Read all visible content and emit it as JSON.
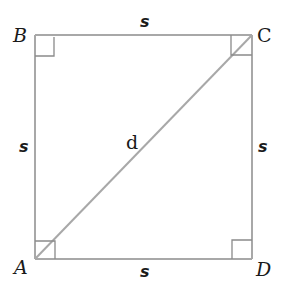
{
  "diagram": {
    "vertices": [
      {
        "name": "A",
        "x": 35,
        "y": 259
      },
      {
        "name": "B",
        "x": 35,
        "y": 35
      },
      {
        "name": "C",
        "x": 252,
        "y": 35
      },
      {
        "name": "D",
        "x": 252,
        "y": 259
      }
    ],
    "labels": {
      "A": "A",
      "B": "B",
      "C": "C",
      "D": "D",
      "side_top": "s",
      "side_left": "s",
      "side_right": "s",
      "side_bottom": "s",
      "diagonal": "d"
    },
    "colors": {
      "line": "#a8a8a8",
      "marker": "#8a8a8a",
      "text": "#1a1a1a"
    }
  }
}
